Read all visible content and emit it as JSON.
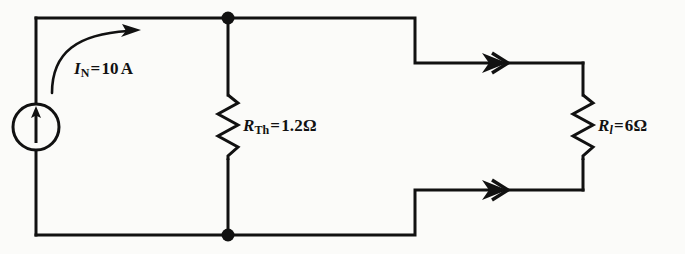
{
  "figure": {
    "name": "norton-equivalent-circuit",
    "background_color": "#fbfbf9",
    "line_color": "#111111"
  },
  "source": {
    "type": "independent-current-source",
    "symbol_name": "current-source-circle-arrow",
    "arrow_direction": "up",
    "reference_arrow_direction": "clockwise",
    "label": {
      "symbol": "I",
      "subscript": "N",
      "equals": "=",
      "value": "10",
      "unit": "A",
      "full_text": "I_N = 10 A"
    }
  },
  "components": [
    {
      "id": "r-th",
      "symbol_name": "resistor-zigzag",
      "label": {
        "symbol": "R",
        "subscript": "Th",
        "equals": "=",
        "value": "1.2",
        "unit": "Ω",
        "full_text": "R_Th = 1.2 Ω"
      }
    },
    {
      "id": "r-load",
      "symbol_name": "resistor-zigzag",
      "label": {
        "symbol": "R",
        "subscript": "l",
        "equals": "=",
        "value": "6",
        "unit": "Ω",
        "full_text": "R_l = 6 Ω"
      }
    }
  ],
  "wire_markers": [
    {
      "id": "current-arrow-top",
      "name": "current-direction-arrow-top",
      "direction": "right"
    },
    {
      "id": "current-arrow-bottom",
      "name": "current-direction-arrow-bottom",
      "direction": "right"
    }
  ],
  "junctions": [
    {
      "id": "node-top",
      "name": "junction-dot-top"
    },
    {
      "id": "node-bottom",
      "name": "junction-dot-bottom"
    }
  ]
}
